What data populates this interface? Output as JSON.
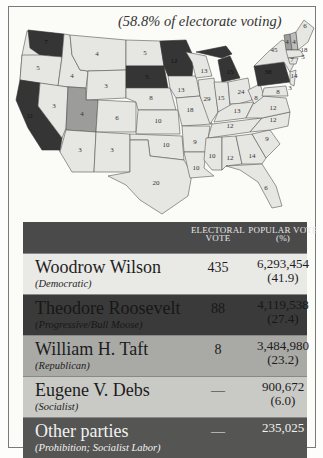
{
  "map": {
    "subtitle": "(58.8% of electorate voting)",
    "legend_colors": {
      "Wilson": "#e6e6e3",
      "Roosevelt": "#353535",
      "Taft": "#9c9c9a",
      "split": "#bdbdbb"
    },
    "state_labels": [
      {
        "state": "WA",
        "votes": "7",
        "winner": "Roosevelt"
      },
      {
        "state": "OR",
        "votes": "5",
        "winner": "Wilson"
      },
      {
        "state": "CA",
        "votes": "11",
        "winner": "Roosevelt"
      },
      {
        "state": "ID",
        "votes": "4",
        "winner": "Wilson"
      },
      {
        "state": "NV",
        "votes": "3",
        "winner": "Wilson"
      },
      {
        "state": "MT",
        "votes": "4",
        "winner": "Wilson"
      },
      {
        "state": "WY",
        "votes": "3",
        "winner": "Wilson"
      },
      {
        "state": "UT",
        "votes": "4",
        "winner": "Taft"
      },
      {
        "state": "CO",
        "votes": "6",
        "winner": "Wilson"
      },
      {
        "state": "AZ",
        "votes": "3",
        "winner": "Wilson"
      },
      {
        "state": "NM",
        "votes": "3",
        "winner": "Wilson"
      },
      {
        "state": "ND",
        "votes": "5",
        "winner": "Wilson"
      },
      {
        "state": "SD",
        "votes": "5",
        "winner": "Roosevelt"
      },
      {
        "state": "NE",
        "votes": "8",
        "winner": "Wilson"
      },
      {
        "state": "KS",
        "votes": "10",
        "winner": "Wilson"
      },
      {
        "state": "OK",
        "votes": "10",
        "winner": "Wilson"
      },
      {
        "state": "TX",
        "votes": "20",
        "winner": "Wilson"
      },
      {
        "state": "MN",
        "votes": "12",
        "winner": "Roosevelt"
      },
      {
        "state": "IA",
        "votes": "13",
        "winner": "Wilson"
      },
      {
        "state": "MO",
        "votes": "18",
        "winner": "Wilson"
      },
      {
        "state": "AR",
        "votes": "9",
        "winner": "Wilson"
      },
      {
        "state": "LA",
        "votes": "10",
        "winner": "Wilson"
      },
      {
        "state": "WI",
        "votes": "13",
        "winner": "Wilson"
      },
      {
        "state": "IL",
        "votes": "29",
        "winner": "Wilson"
      },
      {
        "state": "MI",
        "votes": "15",
        "winner": "Roosevelt"
      },
      {
        "state": "IN",
        "votes": "15",
        "winner": "Wilson"
      },
      {
        "state": "OH",
        "votes": "24",
        "winner": "Wilson"
      },
      {
        "state": "KY",
        "votes": "13",
        "winner": "Wilson"
      },
      {
        "state": "TN",
        "votes": "12",
        "winner": "Wilson"
      },
      {
        "state": "MS",
        "votes": "10",
        "winner": "Wilson"
      },
      {
        "state": "AL",
        "votes": "12",
        "winner": "Wilson"
      },
      {
        "state": "GA",
        "votes": "14",
        "winner": "Wilson"
      },
      {
        "state": "FL",
        "votes": "6",
        "winner": "Wilson"
      },
      {
        "state": "SC",
        "votes": "9",
        "winner": "Wilson"
      },
      {
        "state": "NC",
        "votes": "12",
        "winner": "Wilson"
      },
      {
        "state": "VA",
        "votes": "12",
        "winner": "Wilson"
      },
      {
        "state": "WV",
        "votes": "8",
        "winner": "Wilson"
      },
      {
        "state": "PA",
        "votes": "38",
        "winner": "Roosevelt"
      },
      {
        "state": "NY",
        "votes": "45",
        "winner": "Wilson"
      },
      {
        "state": "VT",
        "votes": "4",
        "winner": "Taft"
      },
      {
        "state": "NH",
        "votes": "4",
        "winner": "Wilson"
      },
      {
        "state": "ME",
        "votes": "6",
        "winner": "Wilson"
      },
      {
        "state": "MA",
        "votes": "18",
        "winner": "Wilson"
      },
      {
        "state": "RI",
        "votes": "5",
        "winner": "Wilson"
      },
      {
        "state": "CT",
        "votes": "7",
        "winner": "Wilson"
      },
      {
        "state": "NJ",
        "votes": "14",
        "winner": "Wilson"
      },
      {
        "state": "DE",
        "votes": "3",
        "winner": "Wilson"
      },
      {
        "state": "MD",
        "votes": "8",
        "winner": "Wilson"
      }
    ]
  },
  "table": {
    "headers": {
      "candidate": "",
      "electoral_line1": "ELECTORAL",
      "electoral_line2": "VOTE",
      "popular_line1": "POPULAR VOTE",
      "popular_line2": "(%)"
    },
    "rows": [
      {
        "name": "Woodrow Wilson",
        "party": "(Democratic)",
        "electoral": "435",
        "popular": "6,293,454",
        "percent": "(41.9)"
      },
      {
        "name": "Theodore Roosevelt",
        "party": "(Progressive/Bull Moose)",
        "electoral": "88",
        "popular": "4,119,538",
        "percent": "(27.4)"
      },
      {
        "name": "William H. Taft",
        "party": "(Republican)",
        "electoral": "8",
        "popular": "3,484,980",
        "percent": "(23.2)"
      },
      {
        "name": "Eugene V. Debs",
        "party": "(Socialist)",
        "electoral": "—",
        "popular": "900,672",
        "percent": "(6.0)"
      },
      {
        "name": "Other parties",
        "party": "(Prohibition; Socialist Labor)",
        "electoral": "—",
        "popular": "235,025",
        "percent": ""
      }
    ]
  }
}
